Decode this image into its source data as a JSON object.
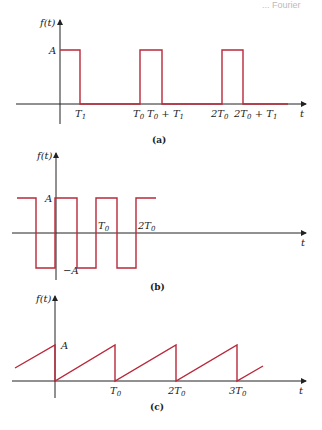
{
  "header": {
    "text": "... Fourier"
  },
  "figures": [
    {
      "id": "a",
      "caption": "(a)",
      "y_axis_label": "f(t)",
      "x_axis_label": "t",
      "level_labels": [
        "A"
      ],
      "tick_labels": [
        "T1",
        "T0",
        "T0 + T1",
        "2T0",
        "2T0 + T1"
      ],
      "description": "Rectangular pulse train: amplitude A from 0 to T1, repeating every T0"
    },
    {
      "id": "b",
      "caption": "(b)",
      "y_axis_label": "f(t)",
      "x_axis_label": "t",
      "level_labels": [
        "A",
        "-A"
      ],
      "tick_labels": [
        "T0",
        "2T0"
      ],
      "description": "Square wave alternating between A and -A with period T0"
    },
    {
      "id": "c",
      "caption": "(c)",
      "y_axis_label": "f(t)",
      "x_axis_label": "t",
      "level_labels": [
        "A"
      ],
      "tick_labels": [
        "T0",
        "2T0",
        "3T0"
      ],
      "description": "Sawtooth wave rising linearly from 0 to A over each period T0"
    }
  ],
  "labels": {
    "a": {
      "ft": "f(t)",
      "A": "A",
      "t": "t",
      "T1": "T",
      "T1_sub": "1",
      "T0": "T",
      "T0_sub": "0",
      "T0pT1_a": "T",
      "T0pT1_sub0": "0",
      "T0pT1_plus": " + T",
      "T0pT1_sub1": "1",
      "twoT0": "2T",
      "twoT0_sub": "0",
      "twoT0pT1": "2T",
      "twoT0pT1_sub0": "0",
      "twoT0pT1_plus": " + T",
      "twoT0pT1_sub1": "1",
      "caption": "(a)"
    },
    "b": {
      "ft": "f(t)",
      "A": "A",
      "mA": "−A",
      "t": "t",
      "T0": "T",
      "T0_sub": "0",
      "twoT0": "2T",
      "twoT0_sub": "0",
      "caption": "(b)"
    },
    "c": {
      "ft": "f(t)",
      "A": "A",
      "t": "t",
      "T0": "T",
      "T0_sub": "0",
      "twoT0": "2T",
      "twoT0_sub": "0",
      "threeT0": "3T",
      "threeT0_sub": "0",
      "caption": "(c)"
    }
  },
  "colors": {
    "signal": "#b8283a",
    "axis": "#222222"
  }
}
